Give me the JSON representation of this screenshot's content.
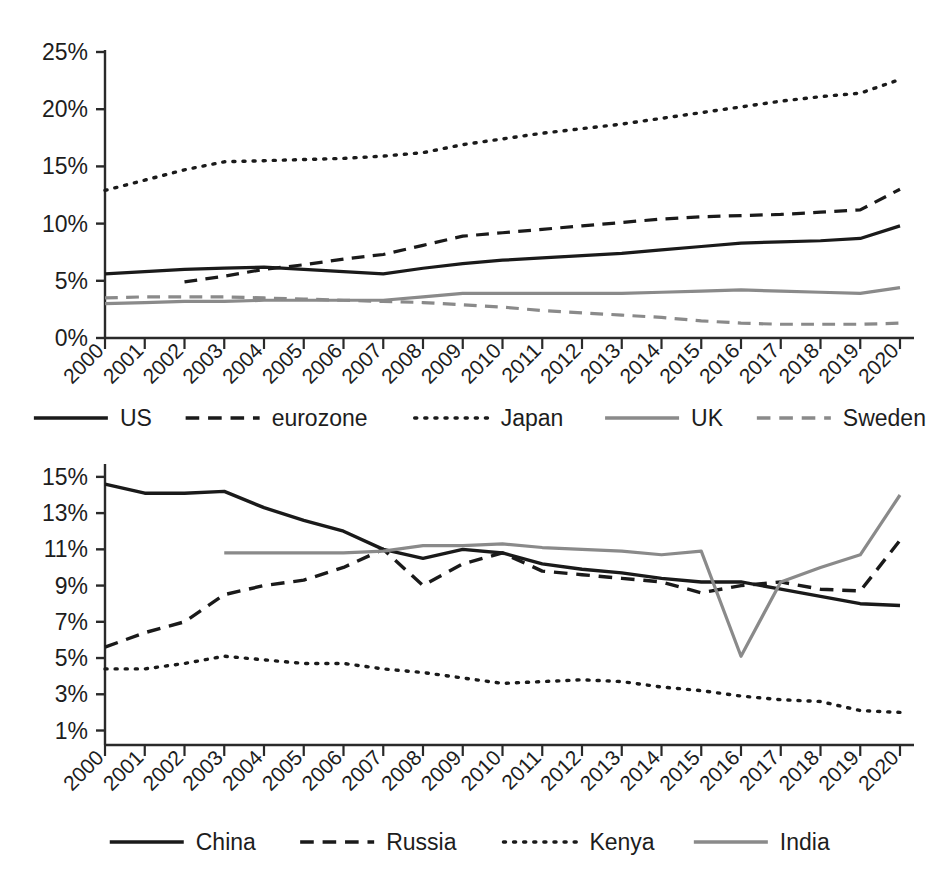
{
  "chart_data": [
    {
      "type": "line",
      "id": "advanced-economies",
      "title": "",
      "xlabel": "",
      "ylabel": "",
      "grid": false,
      "legend_position": "bottom",
      "x": [
        2000,
        2001,
        2002,
        2003,
        2004,
        2005,
        2006,
        2007,
        2008,
        2009,
        2010,
        2011,
        2012,
        2013,
        2014,
        2015,
        2016,
        2017,
        2018,
        2019,
        2020
      ],
      "xtick_labels": [
        "2000",
        "2001",
        "2002",
        "2003",
        "2004",
        "2005",
        "2006",
        "2007",
        "2008",
        "2009",
        "2010",
        "2011",
        "2012",
        "2013",
        "2014",
        "2015",
        "2016",
        "2017",
        "2018",
        "2019",
        "2020"
      ],
      "ytick_labels": [
        "0%",
        "5%",
        "10%",
        "15%",
        "20%",
        "25%"
      ],
      "ytick_values": [
        0,
        5,
        10,
        15,
        20,
        25
      ],
      "ylim": [
        0,
        25
      ],
      "series": [
        {
          "name": "US",
          "style": "solid",
          "color": "#1a1a1a",
          "width": 3.2,
          "values": [
            5.6,
            5.8,
            6.0,
            6.1,
            6.2,
            6.0,
            5.8,
            5.6,
            6.1,
            6.5,
            6.8,
            7.0,
            7.2,
            7.4,
            7.7,
            8.0,
            8.3,
            8.4,
            8.5,
            8.7,
            9.8
          ]
        },
        {
          "name": "eurozone",
          "style": "dashed",
          "color": "#1a1a1a",
          "width": 3.2,
          "values": [
            null,
            null,
            4.9,
            5.4,
            6.0,
            6.4,
            6.9,
            7.3,
            8.1,
            8.9,
            9.2,
            9.5,
            9.8,
            10.1,
            10.4,
            10.6,
            10.7,
            10.8,
            11.0,
            11.2,
            13.0
          ]
        },
        {
          "name": "Japan",
          "style": "dotted",
          "color": "#1a1a1a",
          "width": 3.4,
          "values": [
            12.9,
            13.8,
            14.7,
            15.4,
            15.5,
            15.6,
            15.7,
            15.9,
            16.2,
            16.9,
            17.4,
            17.9,
            18.3,
            18.7,
            19.2,
            19.7,
            20.2,
            20.7,
            21.1,
            21.4,
            22.6
          ]
        },
        {
          "name": "UK",
          "style": "solid",
          "color": "#8a8a8a",
          "width": 3.2,
          "values": [
            3.0,
            3.1,
            3.2,
            3.2,
            3.3,
            3.3,
            3.3,
            3.3,
            3.6,
            3.9,
            3.9,
            3.9,
            3.9,
            3.9,
            4.0,
            4.1,
            4.2,
            4.1,
            4.0,
            3.9,
            4.4
          ]
        },
        {
          "name": "Sweden",
          "style": "dashed",
          "color": "#8a8a8a",
          "width": 3.2,
          "values": [
            3.5,
            3.6,
            3.6,
            3.6,
            3.5,
            3.4,
            3.3,
            3.2,
            3.1,
            2.9,
            2.7,
            2.4,
            2.2,
            2.0,
            1.8,
            1.5,
            1.3,
            1.2,
            1.2,
            1.2,
            1.3
          ]
        }
      ]
    },
    {
      "type": "line",
      "id": "emerging-economies",
      "title": "",
      "xlabel": "",
      "ylabel": "",
      "grid": false,
      "legend_position": "bottom",
      "x": [
        2000,
        2001,
        2002,
        2003,
        2004,
        2005,
        2006,
        2007,
        2008,
        2009,
        2010,
        2011,
        2012,
        2013,
        2014,
        2015,
        2016,
        2017,
        2018,
        2019,
        2020
      ],
      "xtick_labels": [
        "2000",
        "2001",
        "2002",
        "2003",
        "2004",
        "2005",
        "2006",
        "2007",
        "2008",
        "2009",
        "2010",
        "2011",
        "2012",
        "2013",
        "2014",
        "2015",
        "2016",
        "2017",
        "2018",
        "2019",
        "2020"
      ],
      "ytick_labels": [
        "1%",
        "3%",
        "5%",
        "7%",
        "9%",
        "11%",
        "13%",
        "15%"
      ],
      "ytick_values": [
        1,
        3,
        5,
        7,
        9,
        11,
        13,
        15
      ],
      "ylim": [
        0.2,
        15.6
      ],
      "series": [
        {
          "name": "China",
          "style": "solid",
          "color": "#1a1a1a",
          "width": 3.4,
          "values": [
            14.6,
            14.1,
            14.1,
            14.2,
            13.3,
            12.6,
            12.0,
            11.0,
            10.5,
            11.0,
            10.8,
            10.2,
            9.9,
            9.7,
            9.4,
            9.2,
            9.2,
            8.8,
            8.4,
            8.0,
            7.9
          ]
        },
        {
          "name": "Russia",
          "style": "dashed",
          "color": "#1a1a1a",
          "width": 3.4,
          "values": [
            5.6,
            6.4,
            7.0,
            8.5,
            9.0,
            9.3,
            10.0,
            11.0,
            9.0,
            10.2,
            10.8,
            9.8,
            9.6,
            9.4,
            9.2,
            8.6,
            9.0,
            9.2,
            8.8,
            8.7,
            11.5
          ]
        },
        {
          "name": "Kenya",
          "style": "dotted",
          "color": "#1a1a1a",
          "width": 3.4,
          "values": [
            4.4,
            4.4,
            4.7,
            5.1,
            4.9,
            4.7,
            4.7,
            4.4,
            4.2,
            3.9,
            3.6,
            3.7,
            3.8,
            3.7,
            3.4,
            3.2,
            2.9,
            2.7,
            2.6,
            2.1,
            2.0
          ]
        },
        {
          "name": "India",
          "style": "solid",
          "color": "#8a8a8a",
          "width": 3.2,
          "values": [
            null,
            null,
            null,
            10.8,
            10.8,
            10.8,
            10.8,
            10.9,
            11.2,
            11.2,
            11.3,
            11.1,
            11.0,
            10.9,
            10.7,
            10.9,
            5.1,
            9.2,
            10.0,
            10.7,
            14.0
          ]
        }
      ]
    }
  ],
  "legends": [
    {
      "items": [
        {
          "label": "US",
          "style": "solid",
          "color": "#1a1a1a"
        },
        {
          "label": "eurozone",
          "style": "dashed",
          "color": "#1a1a1a"
        },
        {
          "label": "Japan",
          "style": "dotted",
          "color": "#1a1a1a"
        },
        {
          "label": "UK",
          "style": "solid",
          "color": "#8a8a8a"
        },
        {
          "label": "Sweden",
          "style": "dashed",
          "color": "#8a8a8a"
        }
      ]
    },
    {
      "items": [
        {
          "label": "China",
          "style": "solid",
          "color": "#1a1a1a"
        },
        {
          "label": "Russia",
          "style": "dashed",
          "color": "#1a1a1a"
        },
        {
          "label": "Kenya",
          "style": "dotted",
          "color": "#1a1a1a"
        },
        {
          "label": "India",
          "style": "solid",
          "color": "#8a8a8a"
        }
      ]
    }
  ]
}
